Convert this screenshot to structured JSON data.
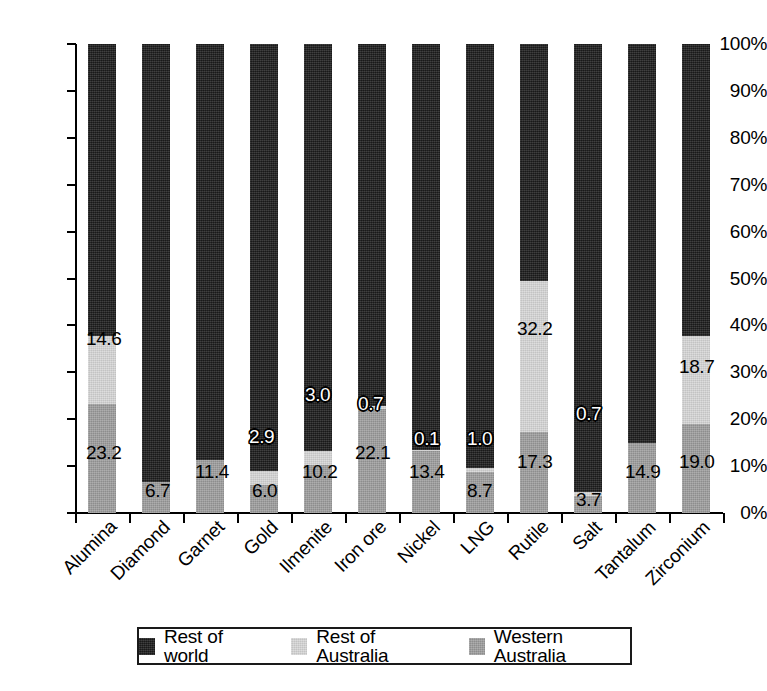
{
  "chart_data": {
    "type": "bar",
    "subtype": "stacked-bar-100-percent",
    "title": "",
    "xlabel": "",
    "ylabel": "",
    "ylim": [
      0,
      100
    ],
    "ytick_labels": [
      "0%",
      "10%",
      "20%",
      "30%",
      "40%",
      "50%",
      "60%",
      "70%",
      "80%",
      "90%",
      "100%"
    ],
    "ytick_values": [
      0,
      10,
      20,
      30,
      40,
      50,
      60,
      70,
      80,
      90,
      100
    ],
    "grid": false,
    "legend_position": "bottom",
    "categories": [
      "Alumina",
      "Diamond",
      "Garnet",
      "Gold",
      "Ilmenite",
      "Iron ore",
      "Nickel",
      "LNG",
      "Rutile",
      "Salt",
      "Tantalum",
      "Zirconium"
    ],
    "series": [
      {
        "name": "Western Australia",
        "color": "#9d9d9d",
        "values": [
          23.2,
          6.7,
          11.4,
          6.0,
          10.2,
          22.1,
          13.4,
          8.7,
          17.3,
          3.7,
          14.9,
          19.0
        ]
      },
      {
        "name": "Rest of Australia",
        "color": "#d3d3d3",
        "values": [
          14.6,
          0.0,
          0.0,
          2.9,
          3.0,
          0.7,
          0.1,
          1.0,
          32.2,
          0.7,
          0.0,
          18.7
        ]
      },
      {
        "name": "Rest of world",
        "color": "#262626",
        "values": [
          62.2,
          93.3,
          88.6,
          91.1,
          86.8,
          77.2,
          86.5,
          90.3,
          50.5,
          95.6,
          85.1,
          62.3
        ]
      }
    ],
    "data_labels": [
      {
        "category": "Alumina",
        "wa": "23.2",
        "roa": "14.6"
      },
      {
        "category": "Diamond",
        "wa": "6.7",
        "roa": null
      },
      {
        "category": "Garnet",
        "wa": "11.4",
        "roa": null
      },
      {
        "category": "Gold",
        "wa": "6.0",
        "roa": "2.9"
      },
      {
        "category": "Ilmenite",
        "wa": "10.2",
        "roa": "3.0"
      },
      {
        "category": "Iron ore",
        "wa": "22.1",
        "roa": "0.7"
      },
      {
        "category": "Nickel",
        "wa": "13.4",
        "roa": "0.1"
      },
      {
        "category": "LNG",
        "wa": "8.7",
        "roa": "1.0"
      },
      {
        "category": "Rutile",
        "wa": "17.3",
        "roa": "32.2"
      },
      {
        "category": "Salt",
        "wa": "3.7",
        "roa": "0.7"
      },
      {
        "category": "Tantalum",
        "wa": "14.9",
        "roa": null
      },
      {
        "category": "Zirconium",
        "wa": "19.0",
        "roa": "18.7"
      }
    ]
  },
  "legend": {
    "items": [
      {
        "label": "Rest of world",
        "color": "#262626"
      },
      {
        "label": "Rest of Australia",
        "color": "#d3d3d3"
      },
      {
        "label": "Western Australia",
        "color": "#9d9d9d"
      }
    ]
  }
}
